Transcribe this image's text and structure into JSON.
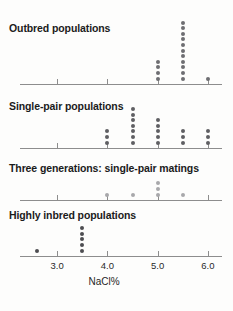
{
  "figure": {
    "width": 233,
    "height": 311,
    "background": "#fdfdfc",
    "axis_color": "#8d8d8d",
    "title_color": "#1b1b1b"
  },
  "xaxis": {
    "title": "NaCl%",
    "tick_labels": [
      "3.0",
      "4.0",
      "5.0",
      "6.0"
    ],
    "tick_values": [
      3.0,
      4.0,
      5.0,
      6.0
    ],
    "range": [
      2.26,
      6.28
    ],
    "pixel_left": 20,
    "pixel_right": 222,
    "px_per_unit": 50.3
  },
  "panels": [
    {
      "title": "Outbred populations",
      "title_y": 22,
      "axis_y": 84,
      "dot_color": "#6e6e72",
      "dot_size": 4.0
    },
    {
      "title": "Single-pair populations",
      "title_y": 100,
      "axis_y": 148,
      "dot_color": "#5f5f63",
      "dot_size": 4.0
    },
    {
      "title": "Three generations: single-pair matings",
      "title_y": 162,
      "axis_y": 200,
      "dot_color": "#a8a8ab",
      "dot_size": 4.0
    },
    {
      "title": "Highly inbred populations",
      "title_y": 209,
      "axis_y": 256,
      "dot_color": "#4d4d51",
      "dot_size": 4.0
    }
  ],
  "chart_data": {
    "type": "scatter",
    "title": "",
    "xlabel": "NaCl%",
    "ylabel": "",
    "xlim": [
      2.26,
      6.28
    ],
    "grid": false,
    "legend": "none",
    "note": "Four stacked one-dimensional dot strip plots (stripcharts). Each dot is one population; dots sharing an x value are stacked vertically.",
    "series": [
      {
        "name": "Outbred populations",
        "color": "#6e6e72",
        "stacks": [
          {
            "x": 5.0,
            "count": 4
          },
          {
            "x": 5.5,
            "count": 11
          },
          {
            "x": 6.0,
            "count": 1
          }
        ],
        "values": [
          5.0,
          5.0,
          5.0,
          5.0,
          5.5,
          5.5,
          5.5,
          5.5,
          5.5,
          5.5,
          5.5,
          5.5,
          5.5,
          5.5,
          5.5,
          6.0
        ]
      },
      {
        "name": "Single-pair populations",
        "color": "#5f5f63",
        "stacks": [
          {
            "x": 4.0,
            "count": 3
          },
          {
            "x": 4.5,
            "count": 7
          },
          {
            "x": 5.0,
            "count": 5
          },
          {
            "x": 5.5,
            "count": 3
          },
          {
            "x": 6.0,
            "count": 3
          }
        ],
        "values": [
          4.0,
          4.0,
          4.0,
          4.5,
          4.5,
          4.5,
          4.5,
          4.5,
          4.5,
          4.5,
          5.0,
          5.0,
          5.0,
          5.0,
          5.0,
          5.5,
          5.5,
          5.5,
          6.0,
          6.0,
          6.0
        ]
      },
      {
        "name": "Three generations: single-pair matings",
        "color": "#a8a8ab",
        "stacks": [
          {
            "x": 4.0,
            "count": 1
          },
          {
            "x": 4.5,
            "count": 1
          },
          {
            "x": 5.0,
            "count": 3
          },
          {
            "x": 5.5,
            "count": 1
          }
        ],
        "values": [
          4.0,
          4.5,
          5.0,
          5.0,
          5.0,
          5.5
        ]
      },
      {
        "name": "Highly inbred populations",
        "color": "#4d4d51",
        "stacks": [
          {
            "x": 2.6,
            "count": 1
          },
          {
            "x": 3.5,
            "count": 5
          }
        ],
        "values": [
          2.6,
          3.5,
          3.5,
          3.5,
          3.5,
          3.5
        ]
      }
    ]
  }
}
